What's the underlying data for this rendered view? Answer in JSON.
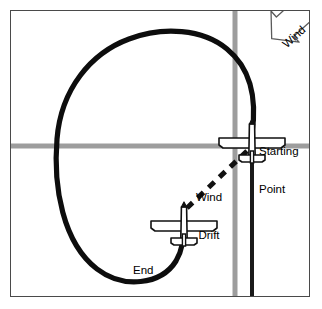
{
  "figure": {
    "labels": {
      "starting_point_line1": "Starting",
      "starting_point_line2": "Point",
      "end_point_line1": "End",
      "end_point_line2": "Point",
      "wind_drift_line1": "Wind",
      "wind_drift_line2": "Drift",
      "wind": "Wind"
    },
    "colors": {
      "ink": "#000000",
      "road_gray": "#9d9d9d",
      "frame": "#4a4a4a",
      "background": "#ffffff",
      "aircraft_fill": "#ffffff"
    },
    "icons": {
      "aircraft": "airplane-top-view-icon",
      "wind_arrow": "wind-arrow-icon",
      "track": "flight-track-curve",
      "drift": "wind-drift-dashed-line"
    },
    "geometry": {
      "frame": {
        "x": 10,
        "y": 10,
        "w": 300,
        "h": 287
      },
      "road_vertical_gray_x": 224,
      "road_horizontal_gray_y": 135,
      "road_vertical_black_x": 241,
      "starting_point": {
        "x": 241,
        "y": 132
      },
      "end_point": {
        "x": 173,
        "y": 215
      },
      "drift_vector": {
        "from_x": 237,
        "from_y": 140,
        "to_x": 175,
        "to_y": 198
      },
      "wind_direction_deg": 225
    }
  }
}
